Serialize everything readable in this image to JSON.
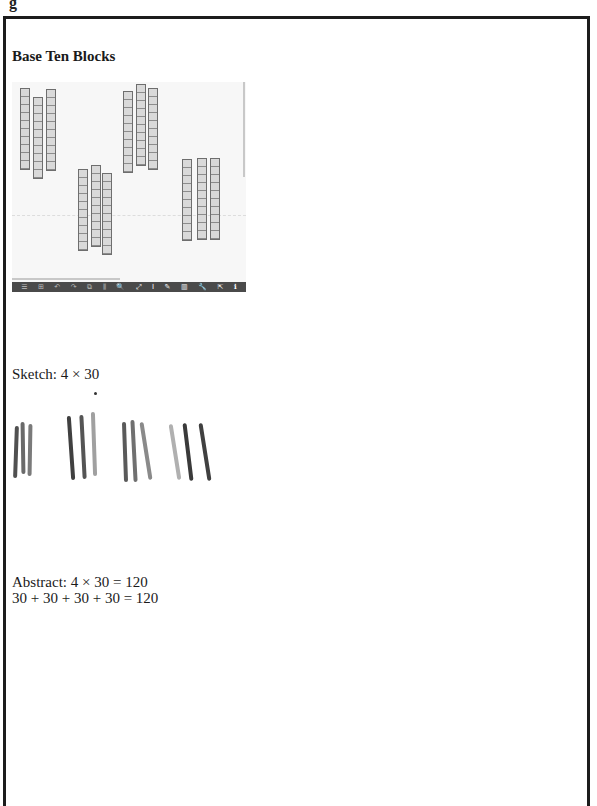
{
  "page": {
    "top_glyph": "g",
    "title": "Base Ten Blocks"
  },
  "canvas": {
    "background": "#f7f7f7",
    "rod_fill": "#d9d9d9",
    "rod_border": "#6e6e6e",
    "groups": [
      {
        "name": "group-1",
        "rods": [
          {
            "x": 8,
            "y": 6,
            "h": 80
          },
          {
            "x": 21,
            "y": 15,
            "h": 80
          },
          {
            "x": 34,
            "y": 7,
            "h": 80
          }
        ]
      },
      {
        "name": "group-2",
        "rods": [
          {
            "x": 66,
            "y": 87,
            "h": 80
          },
          {
            "x": 79,
            "y": 83,
            "h": 80
          },
          {
            "x": 90,
            "y": 91,
            "h": 80
          }
        ]
      },
      {
        "name": "group-3",
        "rods": [
          {
            "x": 111,
            "y": 9,
            "h": 80
          },
          {
            "x": 124,
            "y": 2,
            "h": 80
          },
          {
            "x": 136,
            "y": 6,
            "h": 80
          }
        ]
      },
      {
        "name": "group-4",
        "rods": [
          {
            "x": 170,
            "y": 77,
            "h": 80
          },
          {
            "x": 185,
            "y": 76,
            "h": 80
          },
          {
            "x": 198,
            "y": 76,
            "h": 80
          }
        ]
      }
    ],
    "toolbar": {
      "background": "#4a4a4a",
      "icons": [
        {
          "name": "menu-icon",
          "glyph": "☰"
        },
        {
          "name": "grid-icon",
          "glyph": "⊞"
        },
        {
          "name": "undo-icon",
          "glyph": "↶"
        },
        {
          "name": "redo-icon",
          "glyph": "↷"
        },
        {
          "name": "copy-icon",
          "glyph": "⧉"
        },
        {
          "name": "columns-icon",
          "glyph": "⫼"
        },
        {
          "name": "zoom-icon",
          "glyph": "🔍"
        },
        {
          "name": "fit-icon",
          "glyph": "⤢"
        },
        {
          "name": "text-icon",
          "glyph": "I"
        },
        {
          "name": "pen-icon",
          "glyph": "✎"
        },
        {
          "name": "trash-icon",
          "glyph": "▥"
        },
        {
          "name": "wrench-icon",
          "glyph": "🔧"
        },
        {
          "name": "share-icon",
          "glyph": "⇱"
        },
        {
          "name": "info-icon",
          "glyph": "ℹ"
        }
      ]
    }
  },
  "sketch": {
    "label": "Sketch: 4 × 30",
    "strokes": [
      {
        "x": 4,
        "y": 36,
        "h": 52,
        "rot": 2,
        "color": "#505050"
      },
      {
        "x": 11,
        "y": 32,
        "h": 52,
        "rot": -1,
        "color": "#6a6a6a"
      },
      {
        "x": 18,
        "y": 34,
        "h": 52,
        "rot": 1,
        "color": "#7a7a7a"
      },
      {
        "x": 59,
        "y": 26,
        "h": 64,
        "rot": -4,
        "color": "#404040"
      },
      {
        "x": 71,
        "y": 25,
        "h": 64,
        "rot": -3,
        "color": "#555555"
      },
      {
        "x": 82,
        "y": 22,
        "h": 64,
        "rot": -2,
        "color": "#a0a0a0"
      },
      {
        "x": 113,
        "y": 32,
        "h": 60,
        "rot": -2,
        "color": "#5a5a5a"
      },
      {
        "x": 122,
        "y": 30,
        "h": 62,
        "rot": -3,
        "color": "#707070"
      },
      {
        "x": 134,
        "y": 32,
        "h": 58,
        "rot": -9,
        "color": "#8a8a8a"
      },
      {
        "x": 163,
        "y": 34,
        "h": 56,
        "rot": -9,
        "color": "#b0b0b0"
      },
      {
        "x": 176,
        "y": 33,
        "h": 58,
        "rot": -7,
        "color": "#3a3a3a"
      },
      {
        "x": 193,
        "y": 33,
        "h": 58,
        "rot": -9,
        "color": "#404040"
      }
    ],
    "dot": {
      "x": 84,
      "y": 2
    }
  },
  "abstract": {
    "line1": "Abstract: 4 × 30 = 120",
    "line2": "30 + 30 + 30 + 30 = 120"
  }
}
